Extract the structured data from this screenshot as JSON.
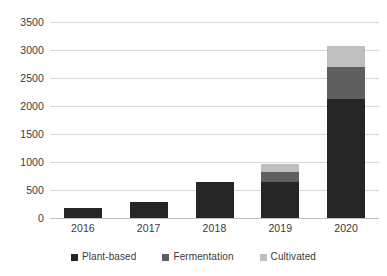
{
  "chart_data": {
    "type": "bar",
    "subtype": "stacked-column",
    "title": "",
    "xlabel": "",
    "ylabel": "",
    "categories": [
      "2016",
      "2017",
      "2018",
      "2019",
      "2020"
    ],
    "series": [
      {
        "name": "Plant-based",
        "color": "#262626",
        "values": [
          180,
          290,
          640,
          650,
          2120
        ]
      },
      {
        "name": "Fermentation",
        "color": "#5f5f5f",
        "values": [
          0,
          0,
          0,
          180,
          580
        ]
      },
      {
        "name": "Cultivated",
        "color": "#bfbfbf",
        "values": [
          0,
          0,
          0,
          140,
          380
        ]
      }
    ],
    "totals": [
      180,
      290,
      640,
      970,
      3080
    ],
    "ylim": [
      0,
      3500
    ],
    "ytick_step": 500,
    "yticks": [
      "3500",
      "3000",
      "2500",
      "2000",
      "1500",
      "1000",
      "500",
      "0"
    ],
    "ytick_values": [
      3500,
      3000,
      2500,
      2000,
      1500,
      1000,
      500,
      0
    ],
    "grid": true,
    "grid_axis": "y",
    "legend": {
      "position": "bottom",
      "entries": [
        {
          "label": "Plant-based",
          "color": "#262626"
        },
        {
          "label": "Fermentation",
          "color": "#5f5f5f"
        },
        {
          "label": "Cultivated",
          "color": "#bfbfbf"
        }
      ]
    }
  }
}
